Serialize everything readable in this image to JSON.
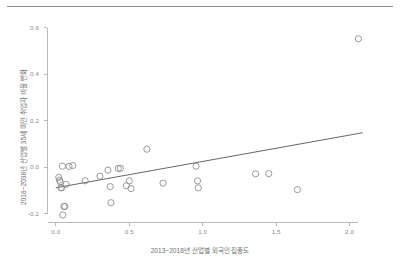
{
  "figure": {
    "background_color": "#ffffff",
    "rule_color": "#8d8d8d",
    "axis_color": "#b9b9b9",
    "marker_color": "#8a8a8a",
    "line_color": "#555555",
    "tick_text_color": "#8a8a8a",
    "label_text_color": "#6e6e6e"
  },
  "chart_data": {
    "type": "scatter",
    "title": "",
    "subtitle": "",
    "xlabel": "2013~2018년 산업별 외국인 집중도",
    "ylabel": "2018~2038년 산업별 35세 미만 취업자 비율 변화",
    "xlim": [
      -0.06,
      2.18
    ],
    "ylim": [
      -0.235,
      0.625
    ],
    "xticks": [
      0.0,
      0.5,
      1.0,
      1.5,
      2.0
    ],
    "xtick_labels": [
      "0.0",
      "0.5",
      "1.0",
      "1.5",
      "2.0"
    ],
    "yticks": [
      -0.2,
      0.0,
      0.2,
      0.4,
      0.6
    ],
    "ytick_labels": [
      "-0.2",
      "0.0",
      "0.2",
      "0.4",
      "0.6"
    ],
    "grid": false,
    "legend": null,
    "legend_position": "none",
    "marker_style": "open-circle",
    "marker_size": 3.1,
    "points": [
      {
        "x": 0.02,
        "y": -0.043
      },
      {
        "x": 0.025,
        "y": -0.055
      },
      {
        "x": 0.03,
        "y": -0.062
      },
      {
        "x": 0.035,
        "y": -0.088
      },
      {
        "x": 0.04,
        "y": -0.088
      },
      {
        "x": 0.045,
        "y": 0.005
      },
      {
        "x": 0.048,
        "y": -0.205
      },
      {
        "x": 0.055,
        "y": -0.168
      },
      {
        "x": 0.062,
        "y": -0.168
      },
      {
        "x": 0.07,
        "y": -0.073
      },
      {
        "x": 0.09,
        "y": 0.004
      },
      {
        "x": 0.115,
        "y": 0.008
      },
      {
        "x": 0.2,
        "y": -0.058
      },
      {
        "x": 0.3,
        "y": -0.038
      },
      {
        "x": 0.355,
        "y": -0.012
      },
      {
        "x": 0.37,
        "y": -0.083
      },
      {
        "x": 0.375,
        "y": -0.152
      },
      {
        "x": 0.425,
        "y": -0.005
      },
      {
        "x": 0.44,
        "y": -0.004
      },
      {
        "x": 0.48,
        "y": -0.079
      },
      {
        "x": 0.5,
        "y": -0.058
      },
      {
        "x": 0.512,
        "y": -0.091
      },
      {
        "x": 0.62,
        "y": 0.078
      },
      {
        "x": 0.73,
        "y": -0.068
      },
      {
        "x": 0.955,
        "y": 0.005
      },
      {
        "x": 0.965,
        "y": -0.058
      },
      {
        "x": 0.97,
        "y": -0.088
      },
      {
        "x": 1.36,
        "y": -0.028
      },
      {
        "x": 1.45,
        "y": -0.027
      },
      {
        "x": 1.645,
        "y": -0.096
      },
      {
        "x": 2.06,
        "y": 0.553
      }
    ],
    "trendline": {
      "type": "linear-fit",
      "x_start": 0.0,
      "y_start": -0.088,
      "x_end": 2.09,
      "y_end": 0.149
    }
  }
}
